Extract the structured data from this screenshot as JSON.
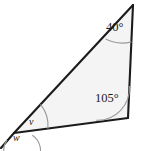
{
  "figure": {
    "type": "geometry-diagram",
    "shape": "triangle",
    "background_color": "#ffffff",
    "fill_color": "#f3f3f3",
    "stroke_color": "#1b1b1b",
    "arc_color": "#8a8a8a",
    "labels": {
      "apex_angle": "40°",
      "bottom_right_angle": "105°",
      "interior_angle": "v",
      "exterior_angle": "w"
    },
    "vertices": {
      "apex": [
        133,
        5
      ],
      "bottom_right": [
        128,
        118
      ],
      "bottom_left": [
        14,
        133
      ],
      "extension_end": [
        1,
        148
      ]
    },
    "angle_values": {
      "apex_degrees": 40,
      "bottom_right_degrees": 105,
      "interior_v_degrees": 35,
      "exterior_w_degrees": 145
    }
  }
}
